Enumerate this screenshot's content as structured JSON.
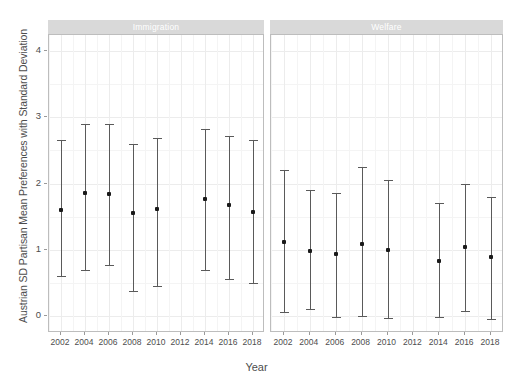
{
  "axis": {
    "ylabel": "Austrian SD Partisan Mean Preferences with Standard Deviation",
    "xlabel": "Year",
    "yticks": [
      "0",
      "1",
      "2",
      "3",
      "4"
    ],
    "xticks": [
      "2002",
      "2004",
      "2006",
      "2008",
      "2010",
      "2012",
      "2014",
      "2016",
      "2018"
    ]
  },
  "panels": [
    {
      "label": "Immigration"
    },
    {
      "label": "Welfare"
    }
  ],
  "chart_data": {
    "type": "scatter",
    "title": "",
    "subtitle": "",
    "xlabel": "Year",
    "ylabel": "Austrian SD Partisan Mean Preferences with Standard Deviation",
    "xlim": [
      2001,
      2019
    ],
    "ylim": [
      -0.25,
      4.35
    ],
    "yticks": [
      0,
      1,
      2,
      3,
      4
    ],
    "xticks": [
      2002,
      2004,
      2006,
      2008,
      2010,
      2012,
      2014,
      2016,
      2018
    ],
    "grid": true,
    "legend": "none",
    "error_bars": "standard deviation (point = mean, whiskers = mean ± SD)",
    "facets": [
      {
        "name": "Immigration",
        "points": [
          {
            "x": 2002,
            "mean": 1.6,
            "low": 0.61,
            "high": 2.66
          },
          {
            "x": 2004,
            "mean": 1.85,
            "low": 0.69,
            "high": 2.9
          },
          {
            "x": 2006,
            "mean": 1.84,
            "low": 0.77,
            "high": 2.9
          },
          {
            "x": 2008,
            "mean": 1.55,
            "low": 0.37,
            "high": 2.6
          },
          {
            "x": 2010,
            "mean": 1.62,
            "low": 0.45,
            "high": 2.68
          },
          {
            "x": 2014,
            "mean": 1.77,
            "low": 0.7,
            "high": 2.82
          },
          {
            "x": 2016,
            "mean": 1.67,
            "low": 0.56,
            "high": 2.72
          },
          {
            "x": 2018,
            "mean": 1.57,
            "low": 0.5,
            "high": 2.65
          }
        ]
      },
      {
        "name": "Welfare",
        "points": [
          {
            "x": 2002,
            "mean": 1.12,
            "low": 0.06,
            "high": 2.2
          },
          {
            "x": 2004,
            "mean": 0.98,
            "low": 0.1,
            "high": 1.9
          },
          {
            "x": 2006,
            "mean": 0.93,
            "low": -0.02,
            "high": 1.86
          },
          {
            "x": 2008,
            "mean": 1.08,
            "low": 0.0,
            "high": 2.25
          },
          {
            "x": 2010,
            "mean": 1.0,
            "low": -0.03,
            "high": 2.05
          },
          {
            "x": 2014,
            "mean": 0.83,
            "low": -0.02,
            "high": 1.7
          },
          {
            "x": 2016,
            "mean": 1.04,
            "low": 0.08,
            "high": 1.99
          },
          {
            "x": 2018,
            "mean": 0.89,
            "low": -0.05,
            "high": 1.79
          }
        ]
      }
    ]
  },
  "colors": {
    "point": "#1a1a1a",
    "whisker": "#5a5a5a",
    "strip_bg": "#d9d9d9",
    "strip_text": "#ffffff",
    "grid": "#ececec",
    "panel_border": "#bdbdbd",
    "text": "#4d4d4d"
  }
}
